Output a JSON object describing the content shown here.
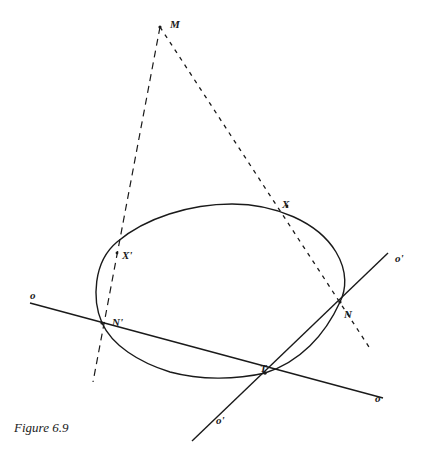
{
  "figure": {
    "caption": "Figure 6.9",
    "colors": {
      "ink": "#1a1a1a",
      "background": "#ffffff"
    }
  },
  "points": {
    "M": {
      "label": "M",
      "x": 160,
      "y": 27
    },
    "X": {
      "label": "X",
      "x": 287,
      "y": 206
    },
    "X_prime": {
      "label": "X'",
      "x": 117,
      "y": 253
    },
    "N_prime": {
      "label": "N'",
      "x": 102,
      "y": 323
    },
    "N": {
      "label": "N",
      "x": 340,
      "y": 302
    },
    "T": {
      "label": "T",
      "x": 265,
      "y": 373
    }
  },
  "lines": {
    "o": {
      "label": "o",
      "label_end": "o",
      "from": [
        30,
        303
      ],
      "to": [
        383,
        398
      ],
      "style": "solid"
    },
    "o_prime": {
      "label": "o'",
      "label_end": "o'",
      "from": [
        388,
        253
      ],
      "to": [
        192,
        441
      ],
      "style": "solid"
    },
    "M_to_N_prime": {
      "from": [
        160,
        27
      ],
      "to": [
        93,
        382
      ],
      "style": "dashed"
    },
    "M_to_N": {
      "from": [
        160,
        27
      ],
      "to": [
        369,
        347
      ],
      "style": "dashed"
    }
  },
  "conic": {
    "type": "ellipse",
    "style": "solid"
  }
}
